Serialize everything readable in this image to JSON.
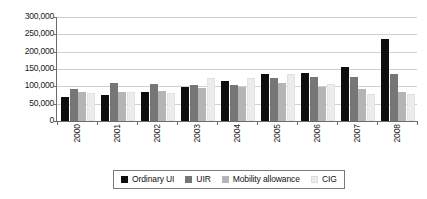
{
  "chart_data": {
    "type": "bar",
    "title": "",
    "subtitle": "",
    "xlabel": "",
    "ylabel": "",
    "categories": [
      "2000",
      "2001",
      "2002",
      "2003",
      "2004",
      "2005",
      "2006",
      "2007",
      "2008"
    ],
    "series": [
      {
        "name": "Ordinary UI",
        "color": "#0d0d0d",
        "values": [
          70000,
          76000,
          85000,
          98000,
          114000,
          135000,
          138000,
          157000,
          237000
        ]
      },
      {
        "name": "UIR",
        "color": "#767676",
        "values": [
          91000,
          110000,
          106000,
          105000,
          105000,
          125000,
          128000,
          128000,
          136000
        ]
      },
      {
        "name": "Mobility allowance",
        "color": "#b5b5b5",
        "values": [
          84000,
          85000,
          88000,
          96000,
          99000,
          111000,
          99000,
          91000,
          85000
        ]
      },
      {
        "name": "CIG",
        "color": "#ececec",
        "values": [
          81000,
          84000,
          81000,
          125000,
          124000,
          135000,
          106000,
          77000,
          79000
        ]
      }
    ],
    "ylim": [
      0,
      300000
    ],
    "ytick_values": [
      0,
      50000,
      100000,
      150000,
      200000,
      250000,
      300000
    ],
    "ytick_labels": [
      "0",
      "50,000",
      "100,000",
      "150,000",
      "200,000",
      "250,000",
      "300,000"
    ],
    "grid": true,
    "grid_axis": "y",
    "legend_position": "bottom",
    "axis_color": "#6b6b6b",
    "grid_color": "#cfcfcf",
    "background": "#ffffff"
  }
}
